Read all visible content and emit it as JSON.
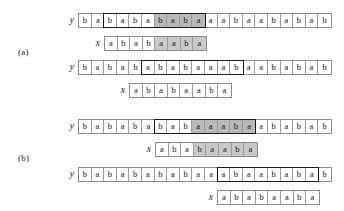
{
  "figure": {
    "groups": [
      {
        "label": "(a)",
        "label_pos": {
          "x": 18,
          "y": 47
        },
        "rows": [
          {
            "name": "row-a1-y",
            "var": "y",
            "pos": {
              "x": 62,
              "y": 12
            },
            "segments": [
              {
                "boxed": false,
                "cells": [
                  {
                    "ch": "b",
                    "shade": "none"
                  },
                  {
                    "ch": "a",
                    "shade": "none"
                  }
                ]
              },
              {
                "boxed": true,
                "cells": [
                  {
                    "ch": "b",
                    "shade": "none"
                  },
                  {
                    "ch": "a",
                    "shade": "none"
                  },
                  {
                    "ch": "b",
                    "shade": "none"
                  },
                  {
                    "ch": "a",
                    "shade": "none"
                  },
                  {
                    "ch": "b",
                    "shade": "dark"
                  },
                  {
                    "ch": "a",
                    "shade": "dark"
                  },
                  {
                    "ch": "b",
                    "shade": "dark"
                  },
                  {
                    "ch": "a",
                    "shade": "dark"
                  }
                ]
              },
              {
                "boxed": false,
                "cells": [
                  {
                    "ch": "a",
                    "shade": "none"
                  },
                  {
                    "ch": "a",
                    "shade": "none"
                  },
                  {
                    "ch": "b",
                    "shade": "none"
                  },
                  {
                    "ch": "a",
                    "shade": "none"
                  },
                  {
                    "ch": "a",
                    "shade": "none"
                  },
                  {
                    "ch": "b",
                    "shade": "none"
                  },
                  {
                    "ch": "a",
                    "shade": "none"
                  },
                  {
                    "ch": "b",
                    "shade": "none"
                  },
                  {
                    "ch": "a",
                    "shade": "none"
                  },
                  {
                    "ch": "b",
                    "shade": "none"
                  }
                ]
              }
            ]
          },
          {
            "name": "row-a1-x",
            "var": "x",
            "pos": {
              "x": 88,
              "y": 35
            },
            "segments": [
              {
                "boxed": false,
                "cells": [
                  {
                    "ch": "a",
                    "shade": "none"
                  },
                  {
                    "ch": "b",
                    "shade": "none"
                  },
                  {
                    "ch": "a",
                    "shade": "none"
                  },
                  {
                    "ch": "b",
                    "shade": "none"
                  },
                  {
                    "ch": "a",
                    "shade": "light"
                  },
                  {
                    "ch": "a",
                    "shade": "light"
                  },
                  {
                    "ch": "b",
                    "shade": "light"
                  },
                  {
                    "ch": "a",
                    "shade": "light"
                  }
                ]
              }
            ]
          },
          {
            "name": "row-a2-y",
            "var": "y",
            "pos": {
              "x": 62,
              "y": 59
            },
            "segments": [
              {
                "boxed": false,
                "cells": [
                  {
                    "ch": "b",
                    "shade": "none"
                  },
                  {
                    "ch": "a",
                    "shade": "none"
                  },
                  {
                    "ch": "b",
                    "shade": "none"
                  },
                  {
                    "ch": "a",
                    "shade": "none"
                  },
                  {
                    "ch": "b",
                    "shade": "none"
                  }
                ]
              },
              {
                "boxed": true,
                "cells": [
                  {
                    "ch": "a",
                    "shade": "none"
                  },
                  {
                    "ch": "b",
                    "shade": "none"
                  },
                  {
                    "ch": "a",
                    "shade": "none"
                  },
                  {
                    "ch": "b",
                    "shade": "none"
                  },
                  {
                    "ch": "a",
                    "shade": "none"
                  },
                  {
                    "ch": "a",
                    "shade": "none"
                  },
                  {
                    "ch": "a",
                    "shade": "none"
                  },
                  {
                    "ch": "b",
                    "shade": "none"
                  }
                ]
              },
              {
                "boxed": false,
                "cells": [
                  {
                    "ch": "a",
                    "shade": "none"
                  },
                  {
                    "ch": "a",
                    "shade": "none"
                  },
                  {
                    "ch": "b",
                    "shade": "none"
                  },
                  {
                    "ch": "a",
                    "shade": "none"
                  },
                  {
                    "ch": "b",
                    "shade": "none"
                  },
                  {
                    "ch": "a",
                    "shade": "none"
                  },
                  {
                    "ch": "b",
                    "shade": "none"
                  }
                ]
              }
            ]
          },
          {
            "name": "row-a2-x",
            "var": "x",
            "pos": {
              "x": 113,
              "y": 82
            },
            "segments": [
              {
                "boxed": false,
                "cells": [
                  {
                    "ch": "a",
                    "shade": "none"
                  },
                  {
                    "ch": "b",
                    "shade": "none"
                  },
                  {
                    "ch": "a",
                    "shade": "none"
                  },
                  {
                    "ch": "b",
                    "shade": "none"
                  },
                  {
                    "ch": "a",
                    "shade": "none"
                  },
                  {
                    "ch": "a",
                    "shade": "none"
                  },
                  {
                    "ch": "b",
                    "shade": "none"
                  },
                  {
                    "ch": "a",
                    "shade": "none"
                  }
                ]
              }
            ]
          }
        ]
      },
      {
        "label": "(b)",
        "label_pos": {
          "x": 18,
          "y": 153
        },
        "rows": [
          {
            "name": "row-b1-y",
            "var": "y",
            "pos": {
              "x": 62,
              "y": 118
            },
            "segments": [
              {
                "boxed": false,
                "cells": [
                  {
                    "ch": "b",
                    "shade": "none"
                  },
                  {
                    "ch": "a",
                    "shade": "none"
                  },
                  {
                    "ch": "b",
                    "shade": "none"
                  },
                  {
                    "ch": "a",
                    "shade": "none"
                  },
                  {
                    "ch": "b",
                    "shade": "none"
                  },
                  {
                    "ch": "a",
                    "shade": "none"
                  }
                ]
              },
              {
                "boxed": true,
                "cells": [
                  {
                    "ch": "b",
                    "shade": "none"
                  },
                  {
                    "ch": "a",
                    "shade": "none"
                  },
                  {
                    "ch": "b",
                    "shade": "none"
                  },
                  {
                    "ch": "a",
                    "shade": "dark"
                  },
                  {
                    "ch": "a",
                    "shade": "dark"
                  },
                  {
                    "ch": "a",
                    "shade": "dark"
                  },
                  {
                    "ch": "b",
                    "shade": "dark"
                  },
                  {
                    "ch": "a",
                    "shade": "dark"
                  }
                ]
              },
              {
                "boxed": false,
                "cells": [
                  {
                    "ch": "a",
                    "shade": "none"
                  },
                  {
                    "ch": "b",
                    "shade": "none"
                  },
                  {
                    "ch": "a",
                    "shade": "none"
                  },
                  {
                    "ch": "b",
                    "shade": "none"
                  },
                  {
                    "ch": "a",
                    "shade": "none"
                  },
                  {
                    "ch": "b",
                    "shade": "none"
                  }
                ]
              }
            ]
          },
          {
            "name": "row-b1-x",
            "var": "x",
            "pos": {
              "x": 139,
              "y": 141
            },
            "segments": [
              {
                "boxed": false,
                "cells": [
                  {
                    "ch": "a",
                    "shade": "none"
                  },
                  {
                    "ch": "b",
                    "shade": "none"
                  },
                  {
                    "ch": "a",
                    "shade": "none"
                  },
                  {
                    "ch": "b",
                    "shade": "light"
                  },
                  {
                    "ch": "a",
                    "shade": "light"
                  },
                  {
                    "ch": "a",
                    "shade": "light"
                  },
                  {
                    "ch": "b",
                    "shade": "light"
                  },
                  {
                    "ch": "a",
                    "shade": "light"
                  }
                ]
              }
            ]
          },
          {
            "name": "row-b2-y",
            "var": "y",
            "pos": {
              "x": 62,
              "y": 166
            },
            "segments": [
              {
                "boxed": false,
                "cells": [
                  {
                    "ch": "b",
                    "shade": "none"
                  },
                  {
                    "ch": "a",
                    "shade": "none"
                  },
                  {
                    "ch": "b",
                    "shade": "none"
                  },
                  {
                    "ch": "a",
                    "shade": "none"
                  },
                  {
                    "ch": "b",
                    "shade": "none"
                  },
                  {
                    "ch": "a",
                    "shade": "none"
                  },
                  {
                    "ch": "b",
                    "shade": "none"
                  },
                  {
                    "ch": "a",
                    "shade": "none"
                  },
                  {
                    "ch": "b",
                    "shade": "none"
                  },
                  {
                    "ch": "a",
                    "shade": "none"
                  },
                  {
                    "ch": "a",
                    "shade": "none"
                  }
                ]
              },
              {
                "boxed": true,
                "cells": [
                  {
                    "ch": "a",
                    "shade": "none"
                  },
                  {
                    "ch": "b",
                    "shade": "none"
                  },
                  {
                    "ch": "a",
                    "shade": "none"
                  },
                  {
                    "ch": "a",
                    "shade": "none"
                  },
                  {
                    "ch": "b",
                    "shade": "none"
                  },
                  {
                    "ch": "a",
                    "shade": "none"
                  },
                  {
                    "ch": "b",
                    "shade": "none"
                  },
                  {
                    "ch": "a",
                    "shade": "none"
                  }
                ]
              },
              {
                "boxed": false,
                "cells": [
                  {
                    "ch": "b",
                    "shade": "none"
                  }
                ]
              }
            ]
          },
          {
            "name": "row-b2-x",
            "var": "x",
            "pos": {
              "x": 201,
              "y": 189
            },
            "segments": [
              {
                "boxed": false,
                "cells": [
                  {
                    "ch": "a",
                    "shade": "none"
                  },
                  {
                    "ch": "b",
                    "shade": "none"
                  },
                  {
                    "ch": "a",
                    "shade": "none"
                  },
                  {
                    "ch": "b",
                    "shade": "none"
                  },
                  {
                    "ch": "a",
                    "shade": "none"
                  },
                  {
                    "ch": "a",
                    "shade": "none"
                  },
                  {
                    "ch": "b",
                    "shade": "none"
                  },
                  {
                    "ch": "a",
                    "shade": "none"
                  }
                ]
              }
            ]
          }
        ]
      }
    ]
  },
  "colors": {
    "shade_dark": "#b9b9b9",
    "shade_light": "#c9c9c9",
    "box_border": "#1a1a1a",
    "strip_border": "#8a8a8a",
    "background": "#ffffff"
  }
}
